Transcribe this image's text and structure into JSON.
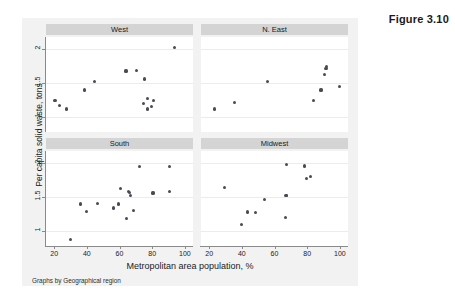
{
  "figure": {
    "label": "Figure 3.10",
    "note": "Graphs by Geographical region",
    "background_color": "#f2f2f2",
    "panel_title_color": "#d4d4d4",
    "marker_color": "#4a4a55"
  },
  "chart_data": {
    "type": "scatter",
    "title": "",
    "xlabel": "Metropolitan area population, %",
    "ylabel": "Per capita solid waste, tons",
    "xlim": [
      15,
      105
    ],
    "ylim": [
      0.78,
      2.18
    ],
    "xticks": [
      20,
      40,
      60,
      80,
      100
    ],
    "yticks": [
      2,
      1.5,
      1
    ],
    "xticklabels": [
      "20",
      "40",
      "60",
      "80",
      "100"
    ],
    "yticklabels": [
      "2",
      "1.5",
      "1"
    ],
    "grid": true,
    "legend": "none",
    "facet_by": "Geographical region",
    "panels": [
      {
        "label": "West",
        "row": 0,
        "col": 0,
        "points": [
          {
            "x": 20.5,
            "y": 1.25
          },
          {
            "x": 23.5,
            "y": 1.17
          },
          {
            "x": 27.5,
            "y": 1.12
          },
          {
            "x": 38.5,
            "y": 1.4
          },
          {
            "x": 44.5,
            "y": 1.52
          },
          {
            "x": 64.0,
            "y": 1.68
          },
          {
            "x": 70.5,
            "y": 1.69
          },
          {
            "x": 75.5,
            "y": 1.56
          },
          {
            "x": 74.5,
            "y": 1.2
          },
          {
            "x": 77.0,
            "y": 1.27
          },
          {
            "x": 77.0,
            "y": 1.12
          },
          {
            "x": 79.5,
            "y": 1.15
          },
          {
            "x": 81.0,
            "y": 1.25
          },
          {
            "x": 93.5,
            "y": 2.02
          }
        ]
      },
      {
        "label": "N. East",
        "row": 0,
        "col": 1,
        "points": [
          {
            "x": 23.5,
            "y": 1.12
          },
          {
            "x": 35.5,
            "y": 1.22
          },
          {
            "x": 55.5,
            "y": 1.52
          },
          {
            "x": 84.0,
            "y": 1.25
          },
          {
            "x": 88.5,
            "y": 1.4
          },
          {
            "x": 90.5,
            "y": 1.63
          },
          {
            "x": 91.5,
            "y": 1.72
          },
          {
            "x": 92.0,
            "y": 1.74
          },
          {
            "x": 100.0,
            "y": 1.45
          }
        ]
      },
      {
        "label": "South",
        "row": 1,
        "col": 0,
        "points": [
          {
            "x": 30.0,
            "y": 0.88
          },
          {
            "x": 36.0,
            "y": 1.4
          },
          {
            "x": 40.0,
            "y": 1.29
          },
          {
            "x": 46.5,
            "y": 1.41
          },
          {
            "x": 56.5,
            "y": 1.34
          },
          {
            "x": 59.5,
            "y": 1.4
          },
          {
            "x": 60.5,
            "y": 1.63
          },
          {
            "x": 64.5,
            "y": 1.18
          },
          {
            "x": 65.5,
            "y": 1.58
          },
          {
            "x": 66.0,
            "y": 1.57
          },
          {
            "x": 66.5,
            "y": 1.52
          },
          {
            "x": 68.5,
            "y": 1.3
          },
          {
            "x": 72.0,
            "y": 1.95
          },
          {
            "x": 80.5,
            "y": 1.56
          },
          {
            "x": 90.5,
            "y": 1.95
          },
          {
            "x": 90.5,
            "y": 1.58
          }
        ]
      },
      {
        "label": "Midwest",
        "row": 1,
        "col": 1,
        "points": [
          {
            "x": 29.5,
            "y": 1.64
          },
          {
            "x": 40.0,
            "y": 1.1
          },
          {
            "x": 43.5,
            "y": 1.28
          },
          {
            "x": 48.5,
            "y": 1.27
          },
          {
            "x": 54.0,
            "y": 1.46
          },
          {
            "x": 66.5,
            "y": 1.2
          },
          {
            "x": 67.0,
            "y": 1.52
          },
          {
            "x": 67.5,
            "y": 1.53
          },
          {
            "x": 67.5,
            "y": 1.98
          },
          {
            "x": 78.5,
            "y": 1.96
          },
          {
            "x": 79.5,
            "y": 1.78
          },
          {
            "x": 82.0,
            "y": 1.8
          }
        ]
      }
    ]
  }
}
